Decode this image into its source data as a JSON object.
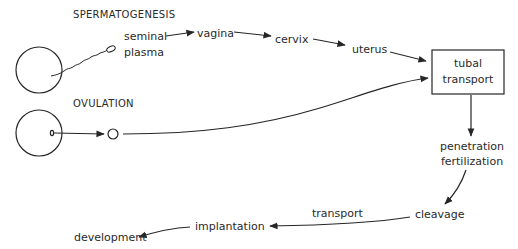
{
  "diagram": {
    "type": "flow",
    "title_labels": {
      "spermatogenesis": "SPERMATOGENESIS",
      "ovulation": "OVULATION"
    },
    "nodes": {
      "seminal_line1": "seminal",
      "seminal_line2": "plasma",
      "vagina": "vagina",
      "cervix": "cervix",
      "uterus": "uterus",
      "tubal_line1": "tubal",
      "tubal_line2": "transport",
      "penetration": "penetration",
      "fertilization": "fertilization",
      "cleavage": "cleavage",
      "transport": "transport",
      "implantation": "implantation",
      "development": "development"
    },
    "edges": [
      {
        "from": "seminal plasma",
        "to": "vagina"
      },
      {
        "from": "vagina",
        "to": "cervix"
      },
      {
        "from": "cervix",
        "to": "uterus"
      },
      {
        "from": "uterus",
        "to": "tubal transport"
      },
      {
        "from": "oocyte (ovulation)",
        "to": "tubal transport"
      },
      {
        "from": "tubal transport",
        "to": "penetration fertilization"
      },
      {
        "from": "penetration fertilization",
        "to": "cleavage"
      },
      {
        "from": "cleavage",
        "to": "implantation",
        "label": "transport"
      },
      {
        "from": "implantation",
        "to": "development"
      }
    ],
    "colors": {
      "ink": "#262626",
      "background": "#ffffff"
    }
  }
}
